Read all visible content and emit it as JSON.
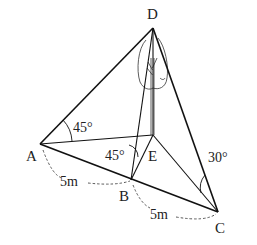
{
  "diagram": {
    "points": {
      "D": {
        "label": "D"
      },
      "A": {
        "label": "A"
      },
      "E": {
        "label": "E"
      },
      "B": {
        "label": "B"
      },
      "C": {
        "label": "C"
      }
    },
    "angles": {
      "DAE": "45°",
      "DBE": "45°",
      "DCE": "30°"
    },
    "distances": {
      "AB": "5m",
      "BC": "5m"
    },
    "object": "tree"
  }
}
